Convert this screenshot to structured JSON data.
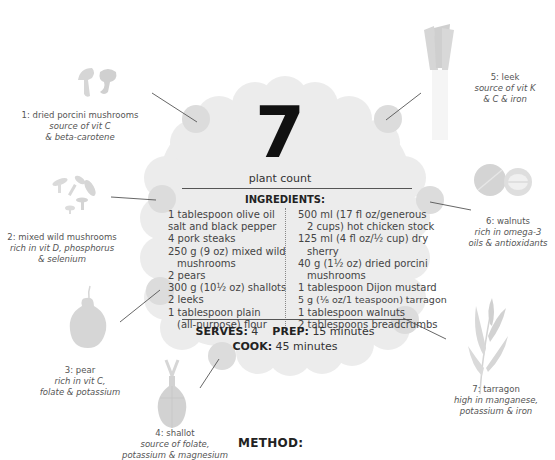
{
  "plant_count": {
    "number": "7",
    "label": "plant count"
  },
  "ingredients": {
    "title": "INGREDIENTS:",
    "left_column": [
      {
        "text": "1 tablespoon olive oil",
        "indent": false
      },
      {
        "text": "salt and black pepper",
        "indent": false
      },
      {
        "text": "4 pork steaks",
        "indent": false
      },
      {
        "text": "250 g (9 oz) mixed wild",
        "indent": false
      },
      {
        "text": "mushrooms",
        "indent": true
      },
      {
        "text": "2 pears",
        "indent": false
      },
      {
        "text": "300 g (10½ oz) shallots",
        "indent": false
      },
      {
        "text": "2 leeks",
        "indent": false
      },
      {
        "text": "1 tablespoon plain",
        "indent": false
      },
      {
        "text": "(all-purpose) flour",
        "indent": true
      }
    ],
    "right_column": [
      {
        "text": "500 ml (17 fl oz/generous",
        "indent": false
      },
      {
        "text": "2 cups) hot chicken stock",
        "indent": true
      },
      {
        "text": "125 ml (4 fl oz/½ cup) dry",
        "indent": false
      },
      {
        "text": "sherry",
        "indent": true
      },
      {
        "text": "40 g (1½ oz) dried porcini",
        "indent": false
      },
      {
        "text": "mushrooms",
        "indent": true
      },
      {
        "text": "1 tablespoon Dijon mustard",
        "indent": false
      },
      {
        "text": "5 g (⅛ oz/1 teaspoon) tarragon",
        "indent": false
      },
      {
        "text": "1 tablespoon walnuts",
        "indent": false
      },
      {
        "text": "2 tablespoons breadcrumbs",
        "indent": false
      }
    ]
  },
  "info": {
    "serves_label": "SERVES:",
    "serves_value": "4",
    "prep_label": "PREP:",
    "prep_value": "15 minutes",
    "cook_label": "COOK:",
    "cook_value": "45 minutes"
  },
  "plants": [
    {
      "name": "1: dried porcini mushrooms",
      "note1": "source of vit C",
      "note2": "& beta-carotene"
    },
    {
      "name": "2: mixed wild mushrooms",
      "note1": "rich in vit D, phosphorus",
      "note2": "& selenium"
    },
    {
      "name": "3: pear",
      "note1": "rich in vit C,",
      "note2": "folate & potassium"
    },
    {
      "name": "4: shallot",
      "note1": "source of folate,",
      "note2": "potassium & magnesium"
    },
    {
      "name": "5: leek",
      "note1": "source of vit K",
      "note2": "& C & iron"
    },
    {
      "name": "6: walnuts",
      "note1": "rich in omega-3",
      "note2": "oils & antioxidants"
    },
    {
      "name": "7: tarragon",
      "note1": "high in manganese,",
      "note2": "potassium & iron"
    }
  ],
  "method": {
    "title": "METHOD:"
  },
  "colors": {
    "blob": "#ececec",
    "hotspot": "#dcdcdc",
    "illustration": "#d6d6d6",
    "text": "#444444"
  }
}
